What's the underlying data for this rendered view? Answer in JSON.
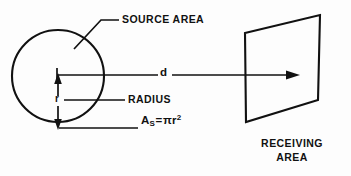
{
  "figure": {
    "background_color": "#fdfdfd",
    "line_color": "#111111",
    "width": 351,
    "height": 176
  },
  "labels": {
    "source_area": "SOURCE AREA",
    "radius": "RADIUS",
    "receiving_area_line1": "RECEIVING",
    "receiving_area_line2": "AREA",
    "distance": "d",
    "radius_symbol": "r",
    "formula_base": "A",
    "formula_subscript": "S",
    "formula_equals": "=",
    "formula_pi": "π",
    "formula_r": "r",
    "formula_exponent": "2"
  },
  "shapes": {
    "source_circle": {
      "name": "source-area-circle",
      "center_x": 58,
      "center_y": 76,
      "radius": 46
    },
    "receiving_plane": {
      "name": "receiving-area-plane",
      "points": "245,33 320,15 318,100 246,122"
    },
    "distance_arrow": {
      "name": "distance-arrow",
      "x1": 58,
      "y1": 75,
      "x2": 300,
      "y2": 75
    },
    "radius_arrow": {
      "name": "radius-dimension-arrow",
      "x": 58,
      "y_top": 75,
      "y_bottom": 128
    }
  }
}
